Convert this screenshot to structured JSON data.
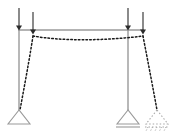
{
  "diagram": {
    "type": "structural-frame-deflection",
    "canvas": {
      "width": 176,
      "height": 132,
      "background": "#ffffff"
    },
    "colors": {
      "undeformed": "#9a9a9a",
      "deformed": "#1a1a1a",
      "load_arrow": "#2b2b2b",
      "support_outline": "#9a9a9a",
      "displaced_support_outline": "#a8a8a8"
    },
    "undeformed_frame": {
      "name": "original-frame",
      "beam": {
        "x1": 19,
        "y1": 30,
        "x2": 143,
        "y2": 30
      },
      "left_column": {
        "x1": 19,
        "y1": 30,
        "x2": 19,
        "y2": 110
      },
      "right_column": {
        "x1": 128,
        "y1": 30,
        "x2": 128,
        "y2": 110
      },
      "stroke_width": 1.4
    },
    "deformed_frame": {
      "name": "deflected-shape",
      "dash_pattern": "1.6,2.2",
      "stroke_width": 1.5,
      "beam_path": "M 33 36 C 60 41, 104 41, 143 36",
      "left_column_path": "M 33 36 C 29 62, 24 88, 20 110",
      "right_column_path": "M 143 36 C 148 62, 153 88, 157 110"
    },
    "loads": [
      {
        "name": "load-arrow-1",
        "x": 19,
        "y_top": 8,
        "y_tip": 31,
        "label": "P"
      },
      {
        "name": "load-arrow-2",
        "x": 33,
        "y_top": 12,
        "y_tip": 35,
        "label": "P"
      },
      {
        "name": "load-arrow-3",
        "x": 128,
        "y_top": 8,
        "y_tip": 31,
        "label": "P"
      },
      {
        "name": "load-arrow-4",
        "x": 143,
        "y_top": 12,
        "y_tip": 35,
        "label": "P"
      }
    ],
    "supports": [
      {
        "name": "pin-support-left",
        "kind": "pinned",
        "apex_x": 19,
        "apex_y": 110,
        "half_width": 11,
        "height": 14,
        "has_base_line": false,
        "style": "solid"
      },
      {
        "name": "roller-support-right",
        "kind": "roller",
        "apex_x": 128,
        "apex_y": 110,
        "half_width": 11,
        "height": 14,
        "has_base_line": true,
        "base_line_gap": 3,
        "style": "solid"
      },
      {
        "name": "roller-support-right-displaced",
        "kind": "roller",
        "apex_x": 157,
        "apex_y": 110,
        "half_width": 11,
        "height": 14,
        "has_base_line": true,
        "base_line_gap": 3,
        "style": "dotted"
      }
    ],
    "hatch_marks": {
      "name": "displaced-support-hatching",
      "count": 5,
      "start_x": 148,
      "spacing": 4.5,
      "y_top": 127,
      "y_bottom": 131
    }
  }
}
